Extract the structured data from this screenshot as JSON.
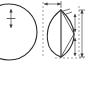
{
  "figure": {
    "background_color": "#ffffff",
    "line_color": "#2b2b2b",
    "dimension_color": "#4a4a4a",
    "extension_color": "#6a6a6a",
    "width_px": 88,
    "height_px": 97
  },
  "views": {
    "left": {
      "name": "circular-view",
      "shape": "circle",
      "description": "Circle cropped at left edge of frame",
      "center": {
        "x": 9,
        "y": 32
      },
      "radius": 28,
      "center_dimension": {
        "label": "",
        "orientation": "vertical",
        "x": 11,
        "y_top": 9,
        "y_bottom": 28
      }
    },
    "right": {
      "name": "lens-view",
      "shape": "lens",
      "description": "Pointed oval (vesica / leaf) with vertical centerline and internal diagonal chord",
      "apex_top": {
        "x": 61,
        "y": 10
      },
      "apex_bottom": {
        "x": 61,
        "y": 57
      },
      "left_extent_x": 47,
      "right_extent_x": 74,
      "centerline": {
        "label": "",
        "x": 61,
        "y_top": 10,
        "y_bottom": 57
      },
      "diagonal_chord": {
        "label": "",
        "from": {
          "x": 61,
          "y": 10
        },
        "to": {
          "x": 74,
          "y": 34
        }
      }
    }
  },
  "dimensions": [
    {
      "name": "top-horizontal-dimension",
      "orientation": "horizontal",
      "label": "",
      "y": 4,
      "x_start": 44,
      "x_end": 61
    },
    {
      "name": "right-vertical-dimension",
      "orientation": "vertical",
      "label": "",
      "x": 82,
      "y_start": 10,
      "y_end": 57
    },
    {
      "name": "inner-vertical-dimension",
      "orientation": "vertical",
      "label": "",
      "x": 75,
      "y_start": 14,
      "y_end": 32
    },
    {
      "name": "lower-vertical-dimension",
      "orientation": "vertical",
      "label": "",
      "x": 75,
      "y_start": 38,
      "y_end": 56
    }
  ],
  "extension_lines": [
    {
      "name": "left-extension-line",
      "x": 43,
      "y_top": 2,
      "y_bottom": 58
    },
    {
      "name": "right-extension-line",
      "x": 79,
      "y_top": 6,
      "y_bottom": 58
    },
    {
      "name": "bottom-extension-line",
      "y": 58,
      "x_start": 55,
      "x_end": 84
    }
  ],
  "labels": {
    "top_dim": "",
    "right_dim": "",
    "inner_dim": "",
    "lower_dim": "",
    "center_dim": ""
  }
}
